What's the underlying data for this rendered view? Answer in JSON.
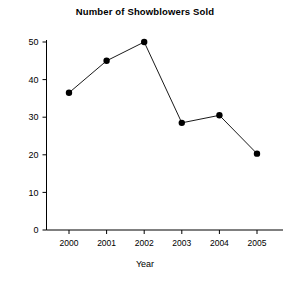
{
  "chart_data": {
    "type": "line",
    "title": "Number of Showblowers Sold",
    "xlabel": "Year",
    "ylabel": "",
    "categories": [
      "2000",
      "2001",
      "2002",
      "2003",
      "2004",
      "2005"
    ],
    "values": [
      36.5,
      45,
      50,
      28.5,
      30.5,
      20.3
    ],
    "x": [
      2000,
      2001,
      2002,
      2003,
      2004,
      2005
    ],
    "xlim": [
      1999.5,
      2005.5
    ],
    "ylim": [
      0,
      53
    ],
    "yticks": [
      0,
      10,
      20,
      30,
      40,
      50
    ],
    "ytick_labels": [
      "0",
      "10",
      "20",
      "30",
      "40",
      "50"
    ],
    "xtick_labels": [
      "2000",
      "2001",
      "2002",
      "2003",
      "2004",
      "2005"
    ],
    "grid": false,
    "legend": null,
    "marker": "filled-circle",
    "line_color": "#000000",
    "marker_color": "#000000",
    "background_color": "#ffffff",
    "series": [
      {
        "name": "Showblowers Sold",
        "values": [
          36.5,
          45,
          50,
          28.5,
          30.5,
          20.3
        ]
      }
    ],
    "points": [
      {
        "label": "2000",
        "value": 36.5
      },
      {
        "label": "2001",
        "value": 45
      },
      {
        "label": "2002",
        "value": 50
      },
      {
        "label": "2003",
        "value": 28.5
      },
      {
        "label": "2004",
        "value": 30.5
      },
      {
        "label": "2005",
        "value": 20.3
      }
    ]
  }
}
